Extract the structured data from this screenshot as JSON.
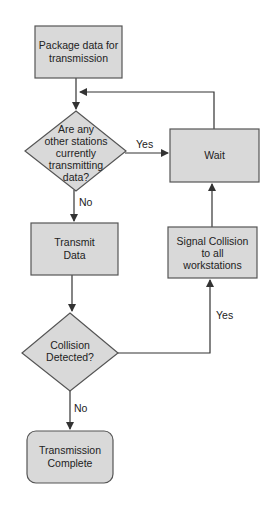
{
  "diagram": {
    "type": "flowchart",
    "colors": {
      "fill": "#d9d9d9",
      "stroke": "#555555",
      "line": "#333333",
      "text": "#222222"
    },
    "nodes": {
      "package": {
        "shape": "rectangle",
        "lines": [
          "Package data for",
          "transmission"
        ]
      },
      "check": {
        "shape": "diamond",
        "lines": [
          "Are any",
          "other stations",
          "currently",
          "transmitting",
          "data?"
        ]
      },
      "wait": {
        "shape": "rectangle",
        "lines": [
          "Wait"
        ]
      },
      "transmit": {
        "shape": "rectangle",
        "lines": [
          "Transmit",
          "Data"
        ]
      },
      "signal": {
        "shape": "rectangle",
        "lines": [
          "Signal Collision",
          "to all",
          "workstations"
        ]
      },
      "collision": {
        "shape": "diamond",
        "lines": [
          "Collision",
          "Detected?"
        ]
      },
      "complete": {
        "shape": "rounded-rectangle",
        "lines": [
          "Transmission",
          "Complete"
        ]
      }
    },
    "edges": [
      {
        "from": "package",
        "to": "check",
        "label": ""
      },
      {
        "from": "check",
        "to": "wait",
        "label": "Yes"
      },
      {
        "from": "wait",
        "to": "check",
        "label": ""
      },
      {
        "from": "check",
        "to": "transmit",
        "label": "No"
      },
      {
        "from": "transmit",
        "to": "collision",
        "label": ""
      },
      {
        "from": "collision",
        "to": "signal",
        "label": "Yes"
      },
      {
        "from": "signal",
        "to": "wait",
        "label": ""
      },
      {
        "from": "collision",
        "to": "complete",
        "label": "No"
      }
    ],
    "edge_labels": {
      "check_yes": "Yes",
      "check_no": "No",
      "collision_yes": "Yes",
      "collision_no": "No"
    }
  }
}
